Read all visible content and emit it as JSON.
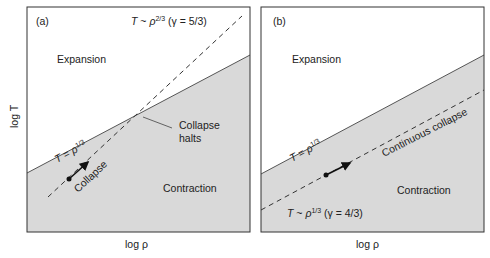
{
  "panels": [
    {
      "id": "a",
      "label": "(a)",
      "region_above": "Expansion",
      "region_below": "Contraction",
      "solid_line_label": {
        "var": "T",
        "eq": " = ",
        "base": "ρ",
        "exp": "1/3"
      },
      "dashed_line_label": {
        "var": "T",
        "eq": " ~ ",
        "base": "ρ",
        "exp": "2/3",
        "gamma": " (γ = 5/3)"
      },
      "arrow_label": "Collapse",
      "annotation_line1": "Collapse",
      "annotation_line2": "halts",
      "xlabel": "log ρ",
      "ylabel": "log T"
    },
    {
      "id": "b",
      "label": "(b)",
      "region_above": "Expansion",
      "region_below": "Contraction",
      "solid_line_label": {
        "var": "T",
        "eq": " = ",
        "base": "ρ",
        "exp": "1/3"
      },
      "dashed_line_label": {
        "var": "T",
        "eq": " ~ ",
        "base": "ρ",
        "exp": "1/3",
        "gamma": " (γ = 4/3)"
      },
      "arrow_label": "Continuous collapse",
      "xlabel": "log ρ"
    }
  ],
  "colors": {
    "contraction_fill": "#d9d9d9",
    "frame": "#333333",
    "line": "#444444",
    "arrow": "#111111"
  }
}
